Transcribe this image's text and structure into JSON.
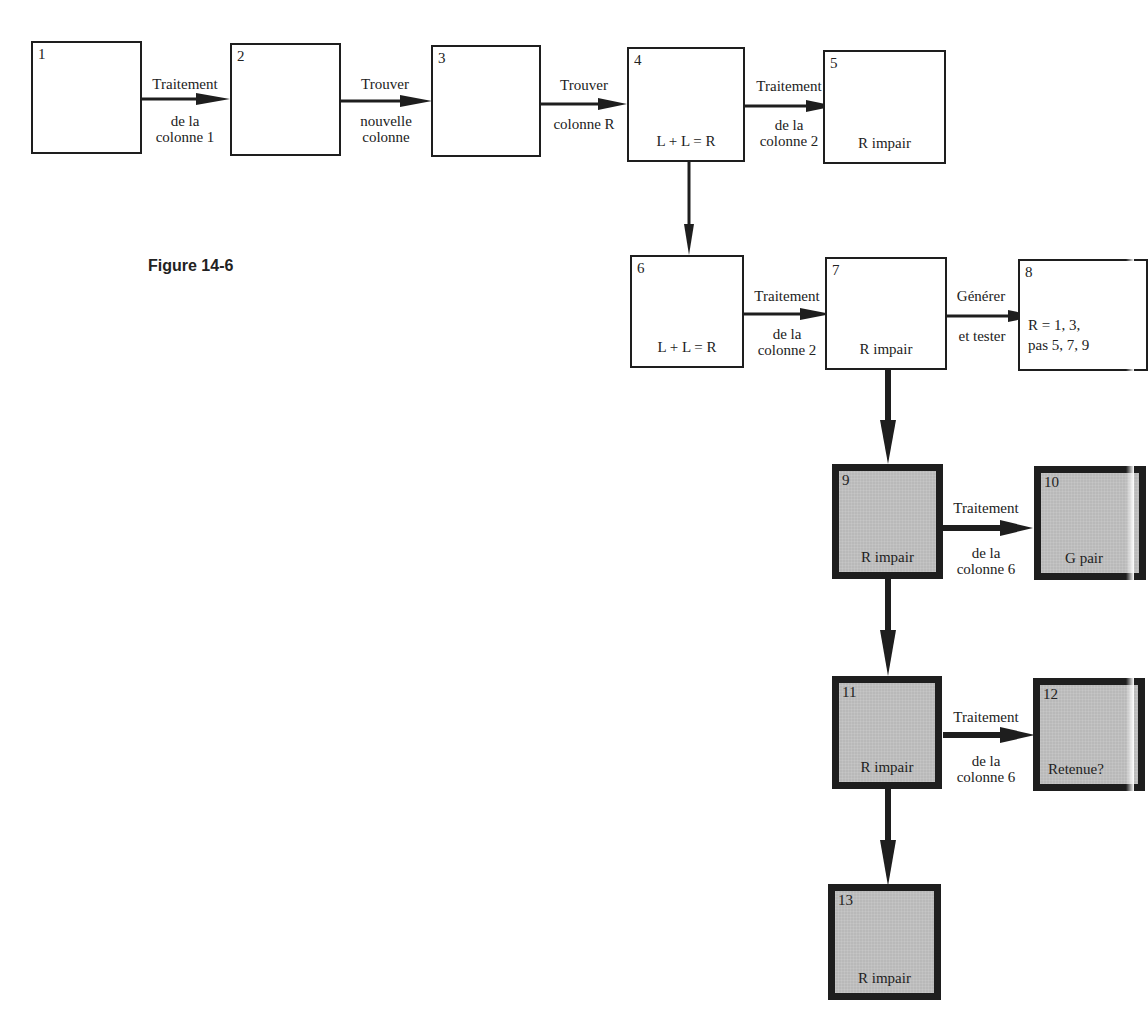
{
  "figure": {
    "caption": "Figure 14-6"
  },
  "boxes": [
    {
      "id": "1",
      "num": "1",
      "text": "",
      "shaded": false
    },
    {
      "id": "2",
      "num": "2",
      "text": "",
      "shaded": false
    },
    {
      "id": "3",
      "num": "3",
      "text": "",
      "shaded": false
    },
    {
      "id": "4",
      "num": "4",
      "text": "L + L = R",
      "shaded": false
    },
    {
      "id": "5",
      "num": "5",
      "text": "R impair",
      "shaded": false
    },
    {
      "id": "6",
      "num": "6",
      "text": "L + L = R",
      "shaded": false
    },
    {
      "id": "7",
      "num": "7",
      "text": "R impair",
      "shaded": false
    },
    {
      "id": "8",
      "num": "8",
      "text_line1": "R = 1, 3,",
      "text_line2": "pas 5, 7, 9",
      "shaded": false
    },
    {
      "id": "9",
      "num": "9",
      "text": "R impair",
      "shaded": true
    },
    {
      "id": "10",
      "num": "10",
      "text": "G pair",
      "shaded": true
    },
    {
      "id": "11",
      "num": "11",
      "text": "R impair",
      "shaded": true
    },
    {
      "id": "12",
      "num": "12",
      "text": "Retenue?",
      "shaded": true
    },
    {
      "id": "13",
      "num": "13",
      "text": "R impair",
      "shaded": true
    }
  ],
  "edges": [
    {
      "from": "1",
      "to": "2",
      "above": "Traitement",
      "below": "de la\ncolonne 1"
    },
    {
      "from": "2",
      "to": "3",
      "above": "Trouver",
      "below": "nouvelle\ncolonne"
    },
    {
      "from": "3",
      "to": "4",
      "above": "Trouver",
      "below": "colonne R"
    },
    {
      "from": "4",
      "to": "5",
      "above": "Traitement",
      "below": "de la\ncolonne 2"
    },
    {
      "from": "4",
      "to": "6",
      "above": "",
      "below": ""
    },
    {
      "from": "6",
      "to": "7",
      "above": "Traitement",
      "below": "de la\ncolonne 2"
    },
    {
      "from": "7",
      "to": "8",
      "above": "Générer",
      "below": "et tester"
    },
    {
      "from": "7",
      "to": "9",
      "above": "",
      "below": ""
    },
    {
      "from": "9",
      "to": "10",
      "above": "Traitement",
      "below": "de la\ncolonne 6"
    },
    {
      "from": "9",
      "to": "11",
      "above": "",
      "below": ""
    },
    {
      "from": "11",
      "to": "12",
      "above": "Traitement",
      "below": "de la\ncolonne 6"
    },
    {
      "from": "11",
      "to": "13",
      "above": "",
      "below": ""
    }
  ]
}
